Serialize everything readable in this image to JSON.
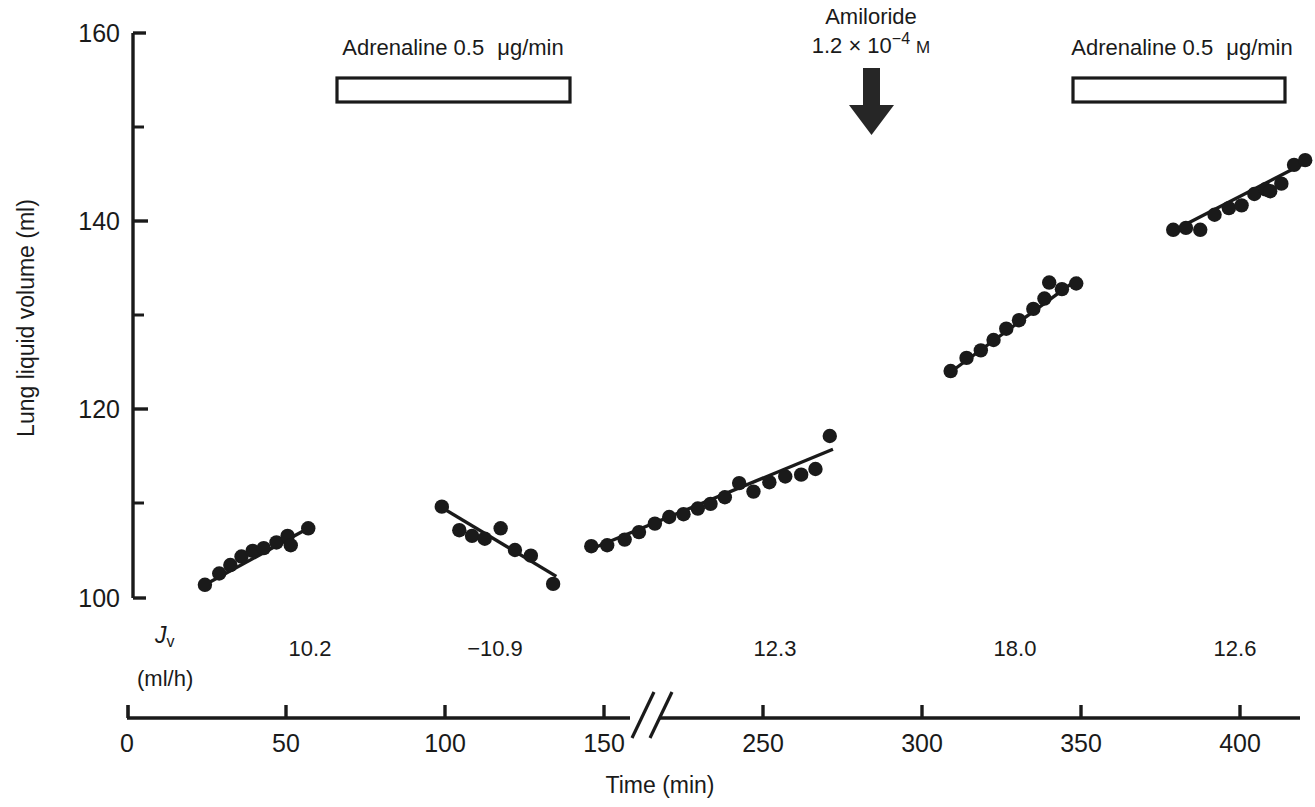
{
  "chart_data": {
    "type": "scatter",
    "title": "",
    "xlabel": "Time (min)",
    "ylabel": "Lung liquid volume (ml)",
    "xlim": [
      0,
      425
    ],
    "ylim": [
      100,
      160
    ],
    "x_ticks": [
      0,
      50,
      100,
      150,
      250,
      300,
      350,
      400
    ],
    "x_tick_labels": [
      "0",
      "50",
      "100",
      "150",
      "250",
      "300",
      "350",
      "400"
    ],
    "y_ticks": [
      100,
      120,
      140,
      160
    ],
    "y_tick_labels": [
      "100",
      "120",
      "140",
      "160"
    ],
    "y_minor_ticks": [
      110,
      130,
      150
    ],
    "grid": false,
    "legend": "none",
    "axis_break": {
      "present": true,
      "at_x": 170,
      "style": "double-slash"
    },
    "series": [
      {
        "name": "segment-1-control",
        "marker": "filled-circle",
        "points": [
          [
            24.5,
            101.4
          ],
          [
            29.0,
            102.6
          ],
          [
            32.5,
            103.5
          ],
          [
            36.0,
            104.4
          ],
          [
            39.5,
            105.0
          ],
          [
            43.0,
            105.3
          ],
          [
            47.0,
            105.9
          ],
          [
            50.5,
            106.6
          ],
          [
            51.5,
            105.6
          ],
          [
            57.0,
            107.4
          ]
        ],
        "fit_line": {
          "x0": 24.5,
          "y0": 101.4,
          "x1": 57.0,
          "y1": 107.4
        }
      },
      {
        "name": "segment-2-adrenaline-1",
        "marker": "filled-circle",
        "points": [
          [
            99.0,
            109.7
          ],
          [
            104.5,
            107.2
          ],
          [
            108.5,
            106.6
          ],
          [
            112.5,
            106.3
          ],
          [
            117.5,
            107.4
          ],
          [
            122.0,
            105.1
          ],
          [
            127.0,
            104.5
          ],
          [
            134.0,
            101.5
          ]
        ],
        "fit_line": {
          "x0": 99.0,
          "y0": 109.6,
          "x1": 135.0,
          "y1": 102.3
        }
      },
      {
        "name": "segment-3-recovery",
        "marker": "filled-circle",
        "points": [
          [
            196.0,
            105.5
          ],
          [
            201.0,
            105.6
          ],
          [
            206.5,
            106.2
          ],
          [
            211.0,
            107.0
          ],
          [
            216.0,
            107.9
          ],
          [
            220.5,
            108.6
          ],
          [
            225.0,
            108.9
          ],
          [
            229.5,
            109.5
          ],
          [
            233.5,
            110.0
          ],
          [
            238.0,
            110.7
          ],
          [
            242.5,
            112.2
          ],
          [
            247.0,
            111.3
          ],
          [
            252.0,
            112.3
          ],
          [
            257.0,
            112.9
          ],
          [
            262.0,
            113.1
          ],
          [
            266.5,
            113.7
          ],
          [
            271.0,
            117.2
          ]
        ],
        "fit_line": {
          "x0": 196.0,
          "y0": 105.2,
          "x1": 272.0,
          "y1": 115.8
        }
      },
      {
        "name": "segment-4-amiloride",
        "marker": "filled-circle",
        "points": [
          [
            309.0,
            124.1
          ],
          [
            314.0,
            125.5
          ],
          [
            318.5,
            126.3
          ],
          [
            322.5,
            127.4
          ],
          [
            326.5,
            128.6
          ],
          [
            330.5,
            129.5
          ],
          [
            335.0,
            130.7
          ],
          [
            338.5,
            131.8
          ],
          [
            340.0,
            133.5
          ],
          [
            344.0,
            132.8
          ],
          [
            348.5,
            133.4
          ]
        ],
        "fit_line": {
          "x0": 309.0,
          "y0": 124.0,
          "x1": 349.5,
          "y1": 134.0
        }
      },
      {
        "name": "segment-5-adrenaline-2",
        "marker": "filled-circle",
        "points": [
          [
            379.0,
            139.1
          ],
          [
            383.0,
            139.3
          ],
          [
            387.5,
            139.1
          ],
          [
            392.0,
            140.7
          ],
          [
            396.5,
            141.4
          ],
          [
            400.5,
            141.7
          ],
          [
            404.5,
            142.9
          ],
          [
            408.0,
            143.4
          ],
          [
            409.5,
            143.2
          ],
          [
            413.0,
            144.0
          ],
          [
            417.0,
            146.0
          ],
          [
            420.5,
            146.5
          ]
        ],
        "fit_line": {
          "x0": 379.0,
          "y0": 139.0,
          "x1": 421.0,
          "y1": 146.3
        }
      }
    ],
    "annotations": [
      {
        "kind": "treatment-bar",
        "name": "adrenaline-bar-1",
        "label_line1": "Adrenaline 0.5",
        "label_unit": "μg/min",
        "x_start": 67,
        "x_end": 143
      },
      {
        "kind": "treatment-bar",
        "name": "adrenaline-bar-2",
        "label_line1": "Adrenaline 0.5",
        "label_unit": "μg/min",
        "x_start": 351,
        "x_end": 422
      },
      {
        "kind": "arrow",
        "name": "amiloride-arrow",
        "label_line1": "Amiloride",
        "label_line2_prefix": "1.2 × 10",
        "label_line2_exponent": "−4",
        "label_line2_unit": "M",
        "x": 283
      }
    ],
    "jv_row": {
      "symbol": "J",
      "symbol_sub": "v",
      "units": "(ml/h)",
      "values": [
        "10.2",
        "−10.9",
        "12.3",
        "18.0",
        "12.6"
      ],
      "value_x": [
        41,
        116,
        231,
        329,
        400
      ]
    }
  }
}
